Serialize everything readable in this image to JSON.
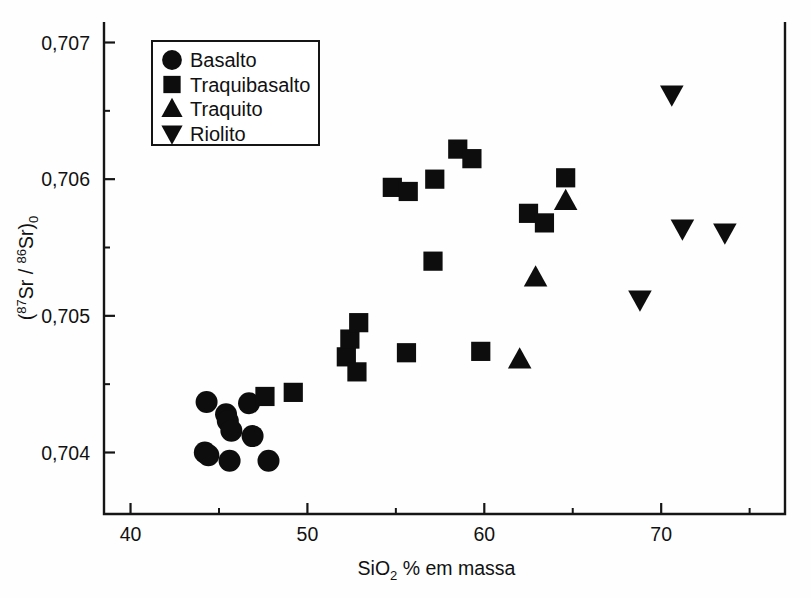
{
  "chart_data": {
    "type": "scatter",
    "title": "",
    "xlabel": "SiO2 % em massa",
    "xlabel_parts": {
      "pre": "SiO",
      "sub": "2",
      "post": " % em massa"
    },
    "ylabel": "(87Sr / 86Sr)0",
    "ylabel_parts": {
      "open": "(",
      "sup1": "87",
      "mid1": "Sr / ",
      "sup2": "86",
      "mid2": "Sr)",
      "sub0": "0"
    },
    "xlim": [
      38.5,
      77.0
    ],
    "ylim": [
      0.70355,
      0.70715
    ],
    "x_ticks_major": [
      40,
      50,
      60,
      70
    ],
    "x_ticks_major_labels": [
      "40",
      "50",
      "60",
      "70"
    ],
    "x_ticks_minor": [
      45,
      55,
      65,
      75
    ],
    "y_ticks_major": [
      0.704,
      0.705,
      0.706,
      0.707
    ],
    "y_ticks_major_labels": [
      "0,704",
      "0,705",
      "0,706",
      "0,707"
    ],
    "y_ticks_minor": [
      0.7045,
      0.7055,
      0.7065
    ],
    "grid": false,
    "legend_position": "top-left",
    "series": [
      {
        "name": "Basalto",
        "marker": "circle",
        "color": "#0d0d0d",
        "points": [
          {
            "x": 44.2,
            "y": 0.704
          },
          {
            "x": 44.4,
            "y": 0.70398
          },
          {
            "x": 44.3,
            "y": 0.70437
          },
          {
            "x": 45.4,
            "y": 0.70428
          },
          {
            "x": 45.5,
            "y": 0.70423
          },
          {
            "x": 45.7,
            "y": 0.70416
          },
          {
            "x": 45.6,
            "y": 0.70394
          },
          {
            "x": 46.7,
            "y": 0.70436
          },
          {
            "x": 46.9,
            "y": 0.70412
          },
          {
            "x": 47.8,
            "y": 0.70394
          }
        ]
      },
      {
        "name": "Traquibasalto",
        "marker": "square",
        "color": "#0d0d0d",
        "points": [
          {
            "x": 47.6,
            "y": 0.70441
          },
          {
            "x": 49.2,
            "y": 0.70444
          },
          {
            "x": 52.2,
            "y": 0.7047
          },
          {
            "x": 52.4,
            "y": 0.70483
          },
          {
            "x": 52.9,
            "y": 0.70495
          },
          {
            "x": 52.8,
            "y": 0.70459
          },
          {
            "x": 54.8,
            "y": 0.70594
          },
          {
            "x": 55.7,
            "y": 0.70591
          },
          {
            "x": 55.6,
            "y": 0.70473
          },
          {
            "x": 57.2,
            "y": 0.706
          },
          {
            "x": 57.1,
            "y": 0.7054
          },
          {
            "x": 58.5,
            "y": 0.70622
          },
          {
            "x": 59.3,
            "y": 0.70615
          },
          {
            "x": 59.8,
            "y": 0.70474
          },
          {
            "x": 62.5,
            "y": 0.70575
          },
          {
            "x": 63.4,
            "y": 0.70568
          },
          {
            "x": 64.6,
            "y": 0.70601
          }
        ]
      },
      {
        "name": "Traquito",
        "marker": "triangle-up",
        "color": "#0d0d0d",
        "points": [
          {
            "x": 62.0,
            "y": 0.70468
          },
          {
            "x": 62.9,
            "y": 0.70528
          },
          {
            "x": 64.6,
            "y": 0.70584
          }
        ]
      },
      {
        "name": "Riolito",
        "marker": "triangle-down",
        "color": "#0d0d0d",
        "points": [
          {
            "x": 68.8,
            "y": 0.70512
          },
          {
            "x": 70.6,
            "y": 0.70662
          },
          {
            "x": 71.2,
            "y": 0.70564
          },
          {
            "x": 73.6,
            "y": 0.70561
          }
        ]
      }
    ],
    "legend_entries": [
      {
        "label": "Basalto",
        "marker": "circle"
      },
      {
        "label": "Traquibasalto",
        "marker": "square"
      },
      {
        "label": "Traquito",
        "marker": "triangle-up"
      },
      {
        "label": "Riolito",
        "marker": "triangle-down"
      }
    ]
  }
}
